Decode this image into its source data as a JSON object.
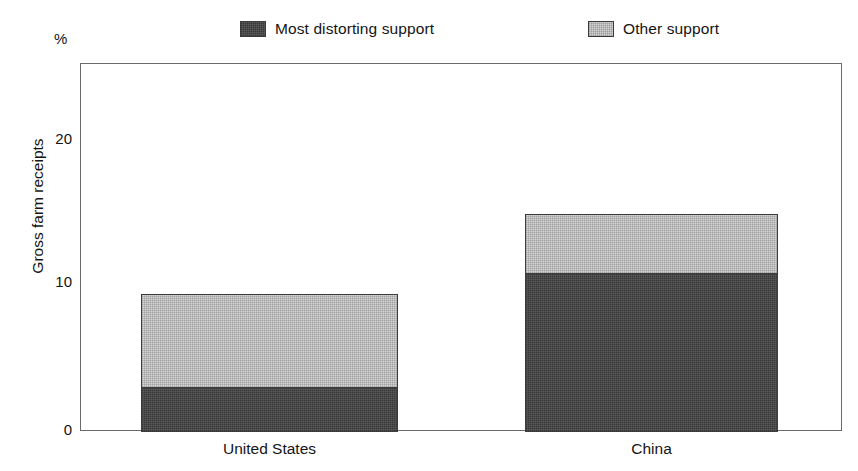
{
  "chart_data": {
    "type": "bar",
    "subtype": "stacked-vertical",
    "title": "",
    "xlabel": "",
    "ylabel": "Gross farm receipts",
    "unit_label": "%",
    "categories": [
      "United States",
      "China"
    ],
    "series": [
      {
        "name": "Most distorting support",
        "values": [
          3.0,
          10.7
        ],
        "color": "#5a5a5a"
      },
      {
        "name": "Other support",
        "values": [
          6.3,
          4.0
        ],
        "color": "#d4d4d4"
      }
    ],
    "totals": [
      9.3,
      14.7
    ],
    "ylim": [
      0,
      24.9
    ],
    "yticks": [
      0,
      10,
      20
    ],
    "ytick_labels": [
      "0",
      "10",
      "20"
    ],
    "grid": false,
    "legend_position": "top"
  },
  "legend": {
    "entries": [
      {
        "label": "Most distorting support",
        "swatch": "dark-swatch-icon"
      },
      {
        "label": "Other support",
        "swatch": "light-swatch-icon"
      }
    ]
  },
  "axes": {
    "y_title": "Gross farm receipts",
    "unit": "%",
    "ticks": [
      {
        "label": "20",
        "value": 20
      },
      {
        "label": "10",
        "value": 10
      },
      {
        "label": "0",
        "value": 0
      }
    ]
  },
  "categories": [
    {
      "label": "United States"
    },
    {
      "label": "China"
    }
  ]
}
